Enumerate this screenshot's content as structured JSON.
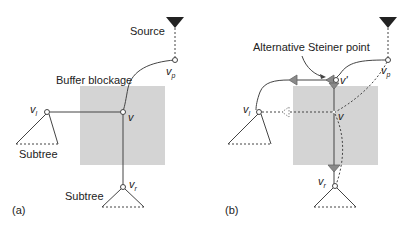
{
  "figure": {
    "panels": [
      {
        "id": "a",
        "caption": "(a)",
        "labels": {
          "source": "Source",
          "blockage": "Buffer blockage",
          "subtree_left": "Subtree",
          "subtree_bottom": "Subtree"
        },
        "nodes": {
          "v": "v",
          "vl": {
            "base": "v",
            "sub": "l"
          },
          "vp": {
            "base": "v",
            "sub": "p"
          },
          "vr": {
            "base": "v",
            "sub": "r"
          }
        }
      },
      {
        "id": "b",
        "caption": "(b)",
        "labels": {
          "steiner": "Alternative Steiner point"
        },
        "nodes": {
          "v": "v",
          "vprime": "v'",
          "vl": {
            "base": "v",
            "sub": "l"
          },
          "vp": {
            "base": "v",
            "sub": "p"
          },
          "vr": {
            "base": "v",
            "sub": "r"
          }
        }
      }
    ],
    "colors": {
      "blockage": "#d4d4d4",
      "line": "#444444",
      "source": "#222222",
      "buffer": "#8a8a8a"
    }
  }
}
